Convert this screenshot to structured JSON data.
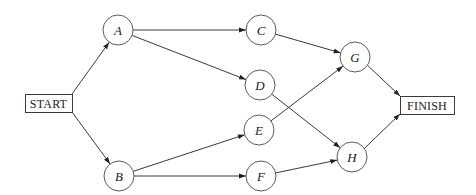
{
  "diagram": {
    "type": "activity-network",
    "nodes": [
      {
        "id": "START",
        "label": "START",
        "shape": "box",
        "x": 25,
        "y": 94,
        "w": 47,
        "h": 18
      },
      {
        "id": "A",
        "label": "A",
        "shape": "circle",
        "cx": 118,
        "cy": 30,
        "r": 15
      },
      {
        "id": "B",
        "label": "B",
        "shape": "circle",
        "cx": 119,
        "cy": 176,
        "r": 15
      },
      {
        "id": "C",
        "label": "C",
        "shape": "circle",
        "cx": 261,
        "cy": 30,
        "r": 15
      },
      {
        "id": "D",
        "label": "D",
        "shape": "circle",
        "cx": 260,
        "cy": 85,
        "r": 15
      },
      {
        "id": "E",
        "label": "E",
        "shape": "circle",
        "cx": 259,
        "cy": 130,
        "r": 15
      },
      {
        "id": "F",
        "label": "F",
        "shape": "circle",
        "cx": 261,
        "cy": 176,
        "r": 15
      },
      {
        "id": "G",
        "label": "G",
        "shape": "circle",
        "cx": 355,
        "cy": 57,
        "r": 15
      },
      {
        "id": "H",
        "label": "H",
        "shape": "circle",
        "cx": 352,
        "cy": 157,
        "r": 15
      },
      {
        "id": "FINISH",
        "label": "FINISH",
        "shape": "box",
        "x": 400,
        "y": 96,
        "w": 54,
        "h": 18
      }
    ],
    "edges": [
      {
        "from": "START",
        "to": "A"
      },
      {
        "from": "START",
        "to": "B"
      },
      {
        "from": "A",
        "to": "C"
      },
      {
        "from": "A",
        "to": "D"
      },
      {
        "from": "B",
        "to": "E"
      },
      {
        "from": "B",
        "to": "F"
      },
      {
        "from": "C",
        "to": "G"
      },
      {
        "from": "D",
        "to": "H"
      },
      {
        "from": "E",
        "to": "G"
      },
      {
        "from": "F",
        "to": "H"
      },
      {
        "from": "G",
        "to": "FINISH"
      },
      {
        "from": "H",
        "to": "FINISH"
      }
    ],
    "colors": {
      "line": "#3a3a3a",
      "node_stroke": "#5a5a5a",
      "background": "#ffffff"
    }
  }
}
